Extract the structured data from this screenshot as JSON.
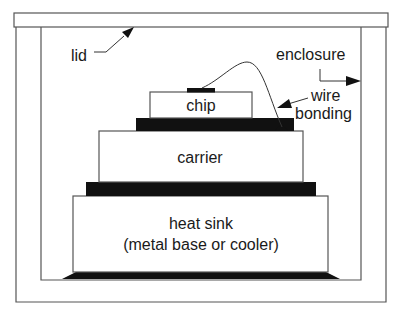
{
  "diagram": {
    "type": "cross-section",
    "labels": {
      "lid": "lid",
      "enclosure": "enclosure",
      "wire_line1": "wire",
      "wire_line2": "bonding",
      "chip": "chip",
      "carrier": "carrier",
      "heatsink_line1": "heat sink",
      "heatsink_line2": "(metal base or cooler)"
    },
    "colors": {
      "stroke": "#4a4a4a",
      "fill_layer": "#ffffff",
      "solder": "#111111",
      "text": "#1a1a1a"
    }
  }
}
